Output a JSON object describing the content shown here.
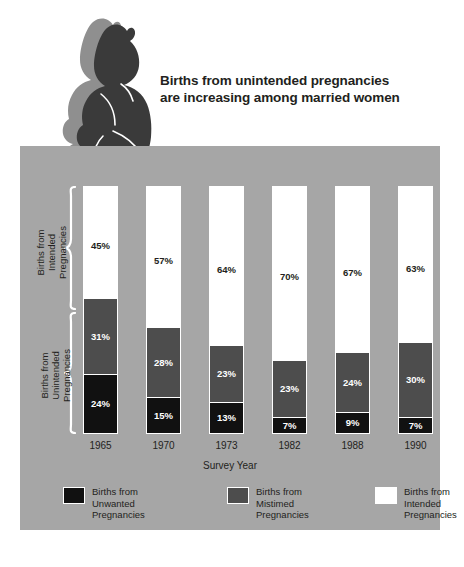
{
  "chart_title": "Births from unintended\npregnancies are increasing\namong married women",
  "panel": {
    "axis_title": "Survey Year",
    "side_label_intended": "Births from\nIntended\nPregnancies",
    "side_label_unintended": "Births from\nUnintended\nPregnancies"
  },
  "legend": {
    "items": [
      {
        "label": "Births from\nUnwanted\nPregnancies",
        "color": "#111111",
        "key": "unwanted"
      },
      {
        "label": "Births from\nMistimed\nPregnancies",
        "color": "#4d4d4d",
        "key": "mistimed"
      },
      {
        "label": "Births from\nIntended\nPregnancies",
        "color": "#ffffff",
        "key": "intended"
      }
    ]
  },
  "colors": {
    "panel_background": "#a6a6a6",
    "page_background": "#ffffff",
    "text": "#231f20",
    "intended": "#ffffff",
    "mistimed": "#4d4d4d",
    "unwanted": "#111111",
    "baby_silhouette": "#3a3a3a",
    "baby_shadow": "#8f8f8f"
  },
  "chart_data": {
    "type": "bar",
    "subtype": "stacked-100-percent",
    "title": "Births from unintended pregnancies are increasing among married women",
    "xlabel": "Survey Year",
    "ylabel": "",
    "ylim": [
      0,
      100
    ],
    "grid": false,
    "legend_position": "bottom",
    "categories": [
      "1965",
      "1970",
      "1973",
      "1982",
      "1988",
      "1990"
    ],
    "series": [
      {
        "name": "Births from Intended Pregnancies",
        "color": "#ffffff",
        "values": [
          45,
          57,
          64,
          70,
          67,
          63
        ],
        "labels": [
          "45%",
          "57%",
          "64%",
          "70%",
          "67%",
          "63%"
        ]
      },
      {
        "name": "Births from Mistimed Pregnancies",
        "color": "#4d4d4d",
        "values": [
          31,
          28,
          23,
          23,
          24,
          30
        ],
        "labels": [
          "31%",
          "28%",
          "23%",
          "23%",
          "24%",
          "30%"
        ]
      },
      {
        "name": "Births from Unwanted Pregnancies",
        "color": "#111111",
        "values": [
          24,
          15,
          13,
          7,
          9,
          7
        ],
        "labels": [
          "24%",
          "15%",
          "13%",
          "7%",
          "9%",
          "7%"
        ]
      }
    ],
    "annotations": [
      {
        "text": "Births from Intended Pregnancies",
        "type": "brace",
        "covers_series": [
          "Births from Intended Pregnancies"
        ]
      },
      {
        "text": "Births from Unintended Pregnancies",
        "type": "brace",
        "covers_series": [
          "Births from Mistimed Pregnancies",
          "Births from Unwanted Pregnancies"
        ]
      }
    ]
  }
}
